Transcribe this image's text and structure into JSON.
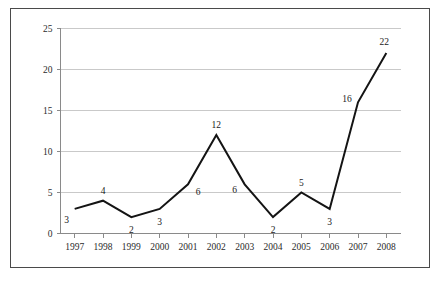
{
  "chart_data": {
    "type": "line",
    "title": "",
    "subtitle": "",
    "xlabel": "",
    "ylabel": "",
    "categories": [
      "1997",
      "1998",
      "1999",
      "2000",
      "2001",
      "2002",
      "2003",
      "2004",
      "2005",
      "2006",
      "2007",
      "2008"
    ],
    "values": [
      3,
      4,
      2,
      3,
      6,
      12,
      6,
      2,
      5,
      3,
      16,
      22
    ],
    "point_labels": [
      "3",
      "4",
      "2",
      "3",
      "6",
      "12",
      "6",
      "2",
      "5",
      "3",
      "16",
      "22"
    ],
    "series": [
      {
        "name": "",
        "values": [
          3,
          4,
          2,
          3,
          6,
          12,
          6,
          2,
          5,
          3,
          16,
          22
        ]
      }
    ],
    "ylim": [
      0,
      25
    ],
    "ytick_values": [
      0,
      5,
      10,
      15,
      20,
      25
    ],
    "ytick_labels": [
      "0",
      "5",
      "10",
      "15",
      "20",
      "25"
    ],
    "xtick_labels": [
      "1997",
      "1998",
      "1999",
      "2000",
      "2001",
      "2002",
      "2003",
      "2004",
      "2005",
      "2006",
      "2007",
      "2008"
    ],
    "grid": "horizontal",
    "legend": "none",
    "annotations": [],
    "colors": {
      "series_line": "#141414",
      "grid": "#c9c9c9",
      "axis": "#8a8a8a",
      "frame_border": "#4a4a4a",
      "background": "#ffffff",
      "text": "#1a1a1a"
    },
    "label_offsets": [
      {
        "dx": -8,
        "dy": 14
      },
      {
        "dx": 0,
        "dy": -7
      },
      {
        "dx": 0,
        "dy": 16
      },
      {
        "dx": 0,
        "dy": 16
      },
      {
        "dx": 10,
        "dy": 11
      },
      {
        "dx": 0,
        "dy": -7
      },
      {
        "dx": -10,
        "dy": 9
      },
      {
        "dx": 0,
        "dy": 16
      },
      {
        "dx": 0,
        "dy": -7
      },
      {
        "dx": 0,
        "dy": 16
      },
      {
        "dx": -11,
        "dy": 0
      },
      {
        "dx": -2,
        "dy": -8
      }
    ]
  }
}
